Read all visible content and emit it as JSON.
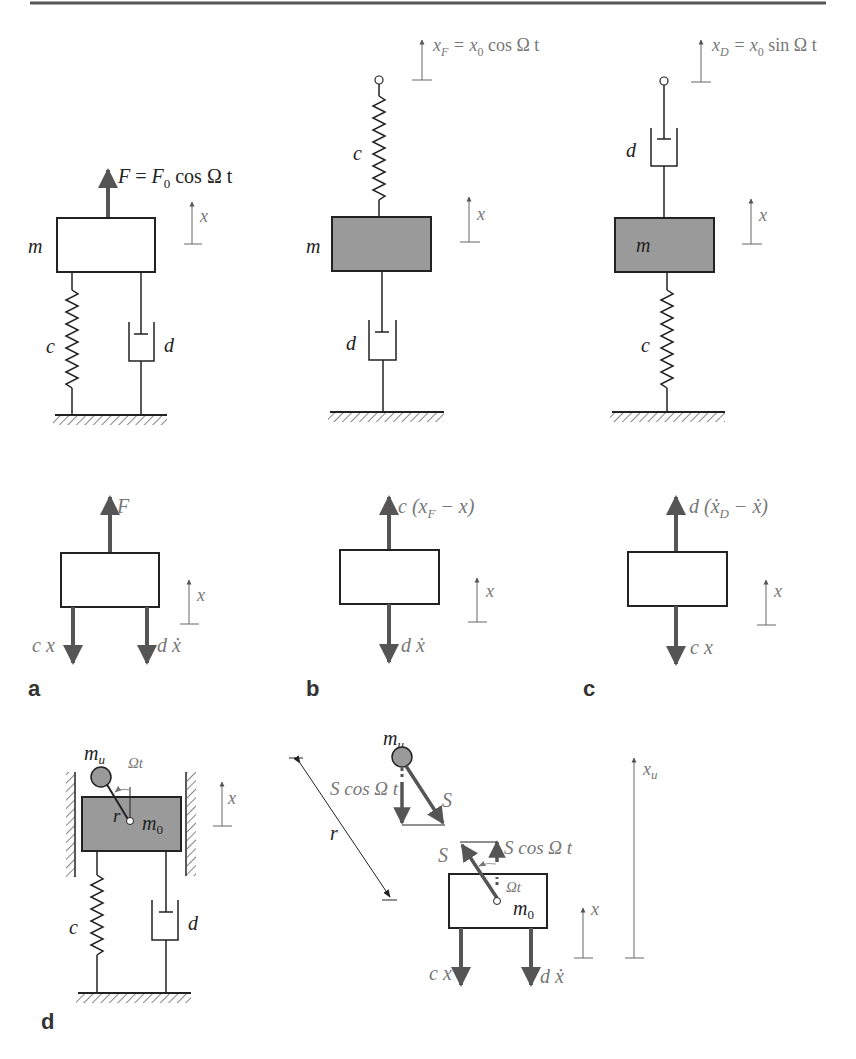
{
  "figure": {
    "top_rule": true,
    "panels": {
      "a": {
        "panel_label": "a",
        "model": {
          "mass_label": "m",
          "mass_fill": "#ffffff",
          "force_label_lhs": "F",
          "force_label_eq": " = ",
          "force_label_F": "F",
          "force_label_sub": "0",
          "force_label_rest": " cos Ω t",
          "spring_label": "c",
          "damper_label": "d",
          "coord_label": "x"
        },
        "fbd": {
          "up_force_label": "F",
          "down_force_left_label": "c x",
          "down_force_right_label": "d ẋ",
          "coord_label": "x"
        }
      },
      "b": {
        "panel_label": "b",
        "model": {
          "mass_label": "m",
          "mass_fill": "#9a9a9a",
          "excitation_label_x": "x",
          "excitation_label_sub": "F",
          "excitation_label_eq": " = x",
          "excitation_label_sub2": "0",
          "excitation_label_rest": " cos Ω t",
          "spring_label": "c",
          "damper_label": "d",
          "coord_label": "x"
        },
        "fbd": {
          "up_force_label_a": "c (x",
          "up_force_label_sub": "F",
          "up_force_label_b": " − x)",
          "down_force_label": "d ẋ",
          "coord_label": "x"
        }
      },
      "c": {
        "panel_label": "c",
        "model": {
          "mass_label": "m",
          "mass_fill": "#9a9a9a",
          "excitation_label_x": "x",
          "excitation_label_sub": "D",
          "excitation_label_eq": " = x",
          "excitation_label_sub2": "0",
          "excitation_label_rest": " sin Ω t",
          "spring_label": "c",
          "damper_label": "d",
          "coord_label": "x"
        },
        "fbd": {
          "up_force_label_a": "d (ẋ",
          "up_force_label_sub": "D",
          "up_force_label_b": " − ẋ)",
          "down_force_label": "c x",
          "coord_label": "x"
        }
      },
      "d": {
        "panel_label": "d",
        "model": {
          "unbalance_mass_label": "m",
          "unbalance_mass_sub": "u",
          "angle_label": "Ωt",
          "radius_label": "r",
          "main_mass_label": "m",
          "main_mass_sub": "0",
          "mass_fill": "#9a9a9a",
          "spring_label": "c",
          "damper_label": "d",
          "coord_label": "x"
        },
        "fbd": {
          "unbalance_mass_label": "m",
          "unbalance_mass_sub": "u",
          "radius_label": "r",
          "force_S_upper": "S",
          "force_comp_upper": "S cos Ω t",
          "force_S_lower": "S",
          "force_comp_lower": "S cos Ω t",
          "angle_label": "Ωt",
          "main_mass_label": "m",
          "main_mass_sub": "0",
          "down_force_left_label": "c x",
          "down_force_right_label": "d ẋ",
          "coord_label": "x",
          "coord_u_label": "x",
          "coord_u_sub": "u"
        }
      }
    },
    "colors": {
      "line": "#222222",
      "arrow_gray": "#555555",
      "label_gray": "#777777",
      "mass_shaded": "#9a9a9a",
      "unbalance_ball": "#9a9a9a"
    }
  }
}
